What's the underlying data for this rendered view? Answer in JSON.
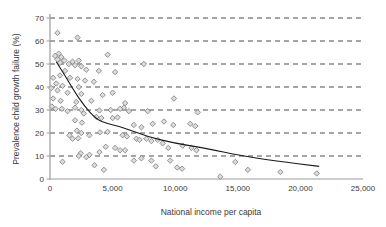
{
  "chart_data": {
    "type": "scatter",
    "title": "",
    "xlabel": "National income per capita",
    "ylabel": "Prevalence child growth failure (%)",
    "xlim": [
      0,
      25000
    ],
    "ylim": [
      0,
      70
    ],
    "xticks": [
      0,
      5000,
      10000,
      15000,
      20000,
      25000
    ],
    "xtick_labels": [
      "0",
      "5,000",
      "10,000",
      "15,000",
      "20,000",
      "25,000"
    ],
    "yticks": [
      0,
      10,
      20,
      30,
      40,
      50,
      60,
      70
    ],
    "ytick_labels": [
      "0",
      "10",
      "20",
      "30",
      "40",
      "50",
      "60",
      "70"
    ],
    "grid": "horizontal-dashed",
    "legend": "none",
    "marker": "diamond",
    "colors": {
      "background": "#ffffff",
      "marker_fill": "#dcdcdc",
      "marker_stroke": "#878787",
      "trend_line": "#1a1a1a",
      "grid_line": "#4d4d4d",
      "axis_line": "#9c9c9c",
      "text": "#3a3a3a"
    },
    "points": [
      [
        600,
        63.5
      ],
      [
        2200,
        61.5
      ],
      [
        400,
        53.5
      ],
      [
        700,
        54.5
      ],
      [
        900,
        53
      ],
      [
        600,
        52
      ],
      [
        1150,
        51.5
      ],
      [
        1800,
        51
      ],
      [
        2300,
        51.5
      ],
      [
        800,
        50.5
      ],
      [
        1500,
        50
      ],
      [
        2000,
        49.5
      ],
      [
        2500,
        49
      ],
      [
        4600,
        54
      ],
      [
        7500,
        50
      ],
      [
        1200,
        47
      ],
      [
        2900,
        47.5
      ],
      [
        3900,
        47
      ],
      [
        5200,
        46.5
      ],
      [
        250,
        44
      ],
      [
        800,
        45
      ],
      [
        1600,
        44
      ],
      [
        2200,
        43.5
      ],
      [
        2800,
        42.8
      ],
      [
        3500,
        42.3
      ],
      [
        500,
        41.5
      ],
      [
        1000,
        40.5
      ],
      [
        2300,
        40
      ],
      [
        100,
        39.5
      ],
      [
        600,
        38.5
      ],
      [
        1400,
        37.5
      ],
      [
        2500,
        37
      ],
      [
        5000,
        37.5
      ],
      [
        4200,
        36.5
      ],
      [
        9900,
        35
      ],
      [
        250,
        35
      ],
      [
        3300,
        34
      ],
      [
        850,
        34
      ],
      [
        2100,
        33.5
      ],
      [
        6000,
        33
      ],
      [
        150,
        31.5
      ],
      [
        450,
        30.5
      ],
      [
        5900,
        31
      ],
      [
        5600,
        30.5
      ],
      [
        4850,
        30
      ],
      [
        11800,
        29
      ],
      [
        950,
        30.5
      ],
      [
        2000,
        31
      ],
      [
        2500,
        30
      ],
      [
        3950,
        29.8
      ],
      [
        1400,
        29.5
      ],
      [
        2700,
        28.5
      ],
      [
        6300,
        29.5
      ],
      [
        7800,
        29.5
      ],
      [
        4100,
        26.5
      ],
      [
        2000,
        25.5
      ],
      [
        5000,
        26.5
      ],
      [
        5400,
        26.8
      ],
      [
        3700,
        27
      ],
      [
        2550,
        24.5
      ],
      [
        6700,
        23.5
      ],
      [
        7300,
        22.5
      ],
      [
        8200,
        24
      ],
      [
        9100,
        25
      ],
      [
        9850,
        23.5
      ],
      [
        11200,
        24
      ],
      [
        11600,
        23
      ],
      [
        2150,
        21
      ],
      [
        2500,
        20
      ],
      [
        4000,
        20.3
      ],
      [
        3150,
        19
      ],
      [
        1550,
        19
      ],
      [
        4600,
        20.5
      ],
      [
        5800,
        19
      ],
      [
        1800,
        17.5
      ],
      [
        2250,
        17.7
      ],
      [
        6150,
        18.5
      ],
      [
        6900,
        17.5
      ],
      [
        7150,
        17
      ],
      [
        7700,
        17.5
      ],
      [
        8100,
        16.5
      ],
      [
        8600,
        17
      ],
      [
        9000,
        15.5
      ],
      [
        4450,
        14
      ],
      [
        5200,
        13.5
      ],
      [
        9450,
        13.5
      ],
      [
        10600,
        14.5
      ],
      [
        11300,
        13.5
      ],
      [
        5600,
        12.5
      ],
      [
        11700,
        12.5
      ],
      [
        6000,
        12.5
      ],
      [
        2450,
        11.2
      ],
      [
        3150,
        10.5
      ],
      [
        3950,
        11.7
      ],
      [
        2300,
        10
      ],
      [
        2900,
        9.5
      ],
      [
        7300,
        9
      ],
      [
        8100,
        8
      ],
      [
        9600,
        8
      ],
      [
        6700,
        8
      ],
      [
        1000,
        7.5
      ],
      [
        3550,
        6
      ],
      [
        4300,
        4
      ],
      [
        8450,
        5.5
      ],
      [
        10150,
        5
      ],
      [
        10550,
        4.5
      ],
      [
        14800,
        7.4
      ],
      [
        13600,
        1
      ],
      [
        15800,
        4
      ],
      [
        18400,
        3
      ],
      [
        21300,
        2.4
      ]
    ],
    "trend_line": [
      [
        500,
        51
      ],
      [
        1200,
        45
      ],
      [
        1900,
        38.5
      ],
      [
        2700,
        32
      ],
      [
        3700,
        26
      ],
      [
        4600,
        24
      ],
      [
        5800,
        22.5
      ],
      [
        7700,
        18.5
      ],
      [
        10000,
        15.5
      ],
      [
        12300,
        13.5
      ],
      [
        15400,
        10
      ],
      [
        17800,
        8
      ],
      [
        21500,
        5.5
      ]
    ]
  }
}
